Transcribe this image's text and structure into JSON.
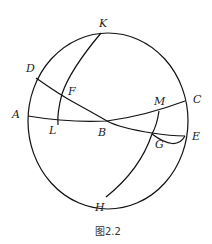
{
  "figure": {
    "caption": "图2.2",
    "points": {
      "K": "K",
      "D": "D",
      "F": "F",
      "A": "A",
      "L": "L",
      "B": "B",
      "M": "M",
      "C": "C",
      "G": "G",
      "E": "E",
      "H": "H"
    },
    "stroke_color": "#111111",
    "background": "#ffffff"
  }
}
